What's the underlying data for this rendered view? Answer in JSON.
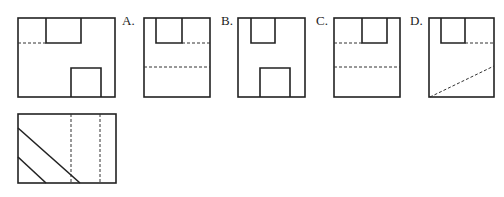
{
  "colors": {
    "stroke": "#222222",
    "background": "#ffffff"
  },
  "figures": {
    "main_view": {
      "label": ""
    },
    "side_view": {
      "label": ""
    }
  },
  "options": [
    {
      "label": "A."
    },
    {
      "label": "B."
    },
    {
      "label": "C."
    },
    {
      "label": "D."
    }
  ]
}
